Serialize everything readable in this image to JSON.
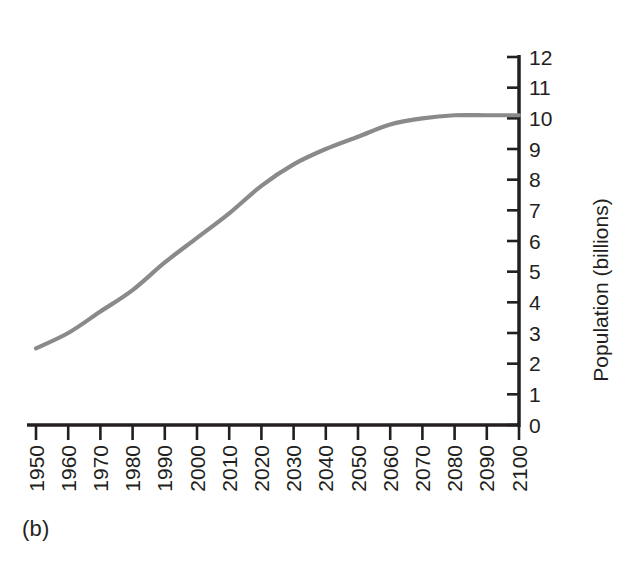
{
  "figure": {
    "panel_caption": "(b)",
    "background_color": "#ffffff"
  },
  "chart_data": {
    "type": "line",
    "title": "",
    "subtitle": "",
    "xlabel": "",
    "ylabel": "Population (billions)",
    "line_color": "#8a8a8a",
    "axis_color": "#231f20",
    "grid": false,
    "legend": null,
    "xlim": [
      1950,
      2100
    ],
    "ylim": [
      0,
      12
    ],
    "y_axis_position": "right",
    "x_tick_labels": [
      "1950",
      "1960",
      "1970",
      "1980",
      "1990",
      "2000",
      "2010",
      "2020",
      "2030",
      "2040",
      "2050",
      "2060",
      "2070",
      "2080",
      "2090",
      "2100"
    ],
    "y_tick_labels": [
      "0",
      "1",
      "2",
      "3",
      "4",
      "5",
      "6",
      "7",
      "8",
      "9",
      "10",
      "11",
      "12"
    ],
    "x_tick_values": [
      1950,
      1960,
      1970,
      1980,
      1990,
      2000,
      2010,
      2020,
      2030,
      2040,
      2050,
      2060,
      2070,
      2080,
      2090,
      2100
    ],
    "y_tick_values": [
      0,
      1,
      2,
      3,
      4,
      5,
      6,
      7,
      8,
      9,
      10,
      11,
      12
    ],
    "x": [
      1950,
      1960,
      1970,
      1980,
      1990,
      2000,
      2010,
      2020,
      2030,
      2040,
      2050,
      2060,
      2070,
      2080,
      2090,
      2100
    ],
    "values": [
      2.5,
      3.0,
      3.7,
      4.4,
      5.3,
      6.1,
      6.9,
      7.8,
      8.5,
      9.0,
      9.4,
      9.8,
      10.0,
      10.1,
      10.1,
      10.1
    ],
    "series": [
      {
        "name": "World population",
        "values": [
          2.5,
          3.0,
          3.7,
          4.4,
          5.3,
          6.1,
          6.9,
          7.8,
          8.5,
          9.0,
          9.4,
          9.8,
          10.0,
          10.1,
          10.1,
          10.1
        ]
      }
    ]
  }
}
